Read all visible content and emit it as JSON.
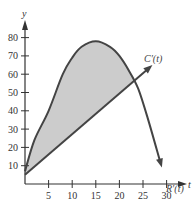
{
  "chart_data": {
    "type": "line",
    "title": "",
    "xlabel": "t",
    "ylabel": "y",
    "xlim": [
      0,
      32
    ],
    "ylim": [
      0,
      88
    ],
    "x_ticks": [
      5,
      10,
      15,
      20,
      25,
      30
    ],
    "y_ticks": [
      10,
      20,
      30,
      40,
      50,
      60,
      70,
      80
    ],
    "grid": false,
    "legend": "none (curves labeled inline)",
    "series": [
      {
        "name": "R'(t)",
        "label": "R′(t)",
        "kind": "curve",
        "x": [
          0,
          2,
          5,
          8,
          10,
          12,
          15,
          18,
          20,
          22,
          24,
          26,
          29
        ],
        "values": [
          7,
          24,
          40,
          60,
          69,
          75,
          78,
          75,
          70,
          62,
          52,
          36,
          9
        ]
      },
      {
        "name": "C'(t)",
        "label": "C′(t)",
        "kind": "line",
        "x": [
          0,
          27
        ],
        "values": [
          5,
          65
        ]
      }
    ],
    "annotations": [
      {
        "type": "shaded-region",
        "description": "Area between R'(t) (upper) and C'(t) (lower) from t=0 to their intersection near t≈24",
        "fill": "#cccccc"
      }
    ]
  },
  "colors": {
    "curve": "#444444",
    "shade": "#cccccc",
    "axis": "#333333"
  }
}
